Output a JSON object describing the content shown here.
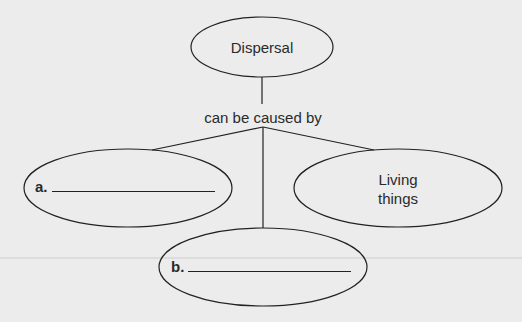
{
  "diagram": {
    "type": "concept-map",
    "root": {
      "label": "Dispersal"
    },
    "connector_label": "can be caused by",
    "children": [
      {
        "id": "a",
        "prefix": "a.",
        "label": "",
        "blank": true
      },
      {
        "id": "b",
        "prefix": "b.",
        "label": "",
        "blank": true
      },
      {
        "id": "c",
        "label_line1": "Living",
        "label_line2": "things",
        "blank": false
      }
    ]
  },
  "colors": {
    "background": "#ececec",
    "stroke": "#222222",
    "text": "#2a2a2a"
  }
}
